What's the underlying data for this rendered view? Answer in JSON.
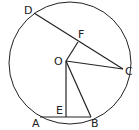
{
  "diagram": {
    "labels": {
      "D": "D",
      "F": "F",
      "O": "O",
      "C": "C",
      "E": "E",
      "A": "A",
      "B": "B"
    },
    "colors": {
      "stroke": "#222222",
      "background": "#ffffff"
    }
  }
}
